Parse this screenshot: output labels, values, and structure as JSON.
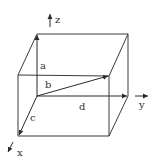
{
  "diagram": {
    "type": "3d-box-vectors",
    "axes": {
      "x": {
        "label": "x",
        "label_pos": [
          19,
          156
        ]
      },
      "y": {
        "label": "y",
        "label_pos": [
          140,
          108
        ]
      },
      "z": {
        "label": "z",
        "label_pos": [
          55,
          23
        ]
      }
    },
    "vectors": [
      {
        "label": "a",
        "label_pos": [
          40,
          69
        ]
      },
      {
        "label": "b",
        "label_pos": [
          45,
          88
        ]
      },
      {
        "label": "c",
        "label_pos": [
          30,
          120
        ]
      },
      {
        "label": "d",
        "label_pos": [
          79,
          110
        ]
      }
    ],
    "colors": {
      "line": "#3a3a3a",
      "text": "#333333",
      "background": "#ffffff"
    }
  }
}
